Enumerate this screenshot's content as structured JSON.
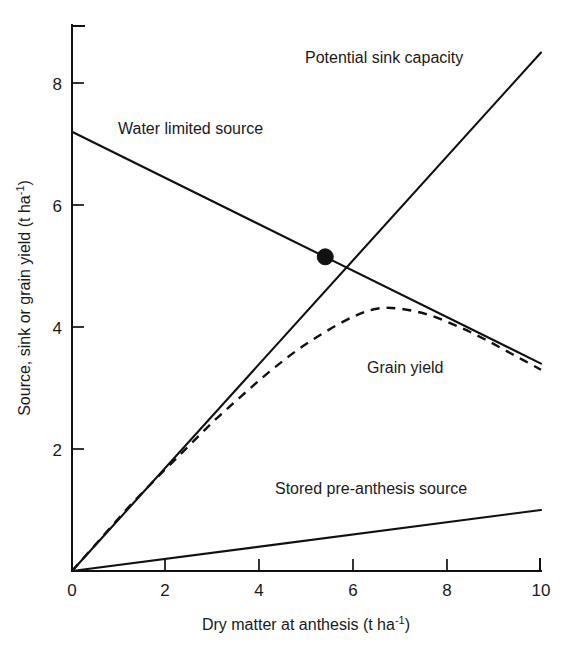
{
  "chart_data": {
    "type": "line",
    "title": "",
    "subtitle": "",
    "xlabel": "Dry matter at anthesis (t ha",
    "xlabel_sup": "-1",
    "xlabel_tail": ")",
    "ylabel": "Source, sink or grain yield (t ha",
    "ylabel_sup": "-1",
    "ylabel_tail": ")",
    "xlim": [
      0,
      10
    ],
    "ylim": [
      0,
      8.8
    ],
    "xticks": [
      "0",
      "2",
      "4",
      "6",
      "8",
      "10"
    ],
    "xtick_values": [
      0,
      2,
      4,
      6,
      8,
      10
    ],
    "yticks": [
      "2",
      "4",
      "6",
      "8"
    ],
    "ytick_values": [
      2,
      4,
      6,
      8
    ],
    "grid": false,
    "legend_position": "inline-annotations",
    "series": [
      {
        "name": "Potential sink capacity",
        "style": "solid",
        "label_x": 5.55,
        "label_y": 8.45,
        "x": [
          0,
          10
        ],
        "values": [
          0,
          8.5
        ]
      },
      {
        "name": "Water limited source",
        "style": "solid",
        "label_x": 1.15,
        "label_y": 7.35,
        "x": [
          0,
          10
        ],
        "values": [
          7.2,
          3.4
        ]
      },
      {
        "name": "Grain yield",
        "style": "dashed",
        "label_x": 6.35,
        "label_y": 3.55,
        "x": [
          0,
          0.6,
          1.2,
          1.8,
          2.4,
          3.0,
          3.6,
          4.2,
          4.8,
          5.4,
          6.0,
          6.5,
          7.0,
          7.6,
          8.2,
          8.8,
          9.4,
          10.0
        ],
        "values": [
          0,
          0.52,
          1.04,
          1.52,
          1.98,
          2.44,
          2.86,
          3.26,
          3.62,
          3.92,
          4.17,
          4.3,
          4.3,
          4.2,
          4.02,
          3.8,
          3.55,
          3.3
        ]
      },
      {
        "name": "Stored pre-anthesis source",
        "style": "solid",
        "label_x": 4.3,
        "label_y": 1.35,
        "x": [
          0,
          10
        ],
        "values": [
          0,
          1.0
        ]
      }
    ],
    "annotations": [
      {
        "name": "intersection-point",
        "kind": "filled-circle",
        "x": 5.4,
        "y": 5.15,
        "color": "#111111"
      }
    ],
    "colors": {
      "line": "#111111",
      "axis": "#111111",
      "background": "#ffffff",
      "text": "#1a1a1a"
    }
  }
}
